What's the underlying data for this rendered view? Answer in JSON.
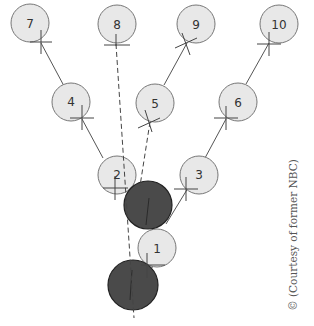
{
  "diagram": {
    "title": "",
    "colors": {
      "light_node_fill": "#e8e8e8",
      "light_node_stroke": "#777777",
      "dark_node_fill": "#4a4a4a",
      "dark_node_stroke": "#222222",
      "line": "#555555",
      "background": "#ffffff"
    },
    "nodes": [
      {
        "id": "1",
        "label": "1",
        "cx": 157,
        "cy": 248,
        "r": 19,
        "style": "light"
      },
      {
        "id": "2",
        "label": "2",
        "cx": 117,
        "cy": 175,
        "r": 19,
        "style": "light"
      },
      {
        "id": "3",
        "label": "3",
        "cx": 199,
        "cy": 175,
        "r": 19,
        "style": "light"
      },
      {
        "id": "4",
        "label": "4",
        "cx": 71,
        "cy": 102,
        "r": 19,
        "style": "light"
      },
      {
        "id": "5",
        "label": "5",
        "cx": 155,
        "cy": 103,
        "r": 19,
        "style": "light"
      },
      {
        "id": "6",
        "label": "6",
        "cx": 238,
        "cy": 102,
        "r": 19,
        "style": "light"
      },
      {
        "id": "7",
        "label": "7",
        "cx": 30,
        "cy": 23,
        "r": 19,
        "style": "light"
      },
      {
        "id": "8",
        "label": "8",
        "cx": 117,
        "cy": 24,
        "r": 19,
        "style": "light"
      },
      {
        "id": "9",
        "label": "9",
        "cx": 196,
        "cy": 24,
        "r": 19,
        "style": "light"
      },
      {
        "id": "10",
        "label": "10",
        "cx": 279,
        "cy": 24,
        "r": 19,
        "style": "light"
      },
      {
        "id": "A",
        "label": "",
        "cx": 148,
        "cy": 205,
        "r": 24,
        "style": "dark"
      },
      {
        "id": "B",
        "label": "",
        "cx": 133,
        "cy": 285,
        "r": 25,
        "style": "dark"
      }
    ],
    "edges": [
      {
        "from": "4",
        "to": "7",
        "style": "solid"
      },
      {
        "from": "2",
        "to": "4",
        "style": "solid"
      },
      {
        "from": "5",
        "to": "9",
        "style": "solid"
      },
      {
        "from": "6",
        "to": "10",
        "style": "solid"
      },
      {
        "from": "3",
        "to": "6",
        "style": "solid"
      },
      {
        "from": "A",
        "to": "3",
        "style": "solid"
      },
      {
        "from": "8",
        "to": "B",
        "style": "dashed"
      },
      {
        "from": "5",
        "to": "A",
        "style": "dashed"
      }
    ],
    "credit": "© (Courtesy of former NBC)"
  }
}
